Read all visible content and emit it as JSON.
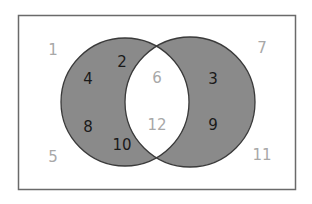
{
  "diagram": {
    "type": "venn",
    "universe": [
      "1",
      "2",
      "3",
      "4",
      "5",
      "6",
      "7",
      "8",
      "9",
      "10",
      "11",
      "12"
    ],
    "sets": [
      {
        "name": "A",
        "elements": [
          "2",
          "4",
          "6",
          "8",
          "10",
          "12"
        ]
      },
      {
        "name": "B",
        "elements": [
          "3",
          "6",
          "9",
          "12"
        ]
      }
    ],
    "shaded_region": "symmetric difference (A xor B)",
    "regions": {
      "outside": {
        "elements": [
          "1",
          "5",
          "7",
          "11"
        ],
        "shaded": false
      },
      "a_only": {
        "elements": [
          "2",
          "4",
          "8",
          "10"
        ],
        "shaded": true
      },
      "intersection": {
        "elements": [
          "6",
          "12"
        ],
        "shaded": false
      },
      "b_only": {
        "elements": [
          "3",
          "9"
        ],
        "shaded": true
      }
    },
    "colors": {
      "shade": "#8a8a8a",
      "outline": "#3a3a3a",
      "frame": "#6a6a6a",
      "shaded_text": "#1a1a1a",
      "unshaded_text": "#a8a8a8"
    },
    "labels": {
      "n1": "1",
      "n2": "2",
      "n3": "3",
      "n4": "4",
      "n5": "5",
      "n6": "6",
      "n7": "7",
      "n8": "8",
      "n9": "9",
      "n10": "10",
      "n11": "11",
      "n12": "12"
    }
  }
}
